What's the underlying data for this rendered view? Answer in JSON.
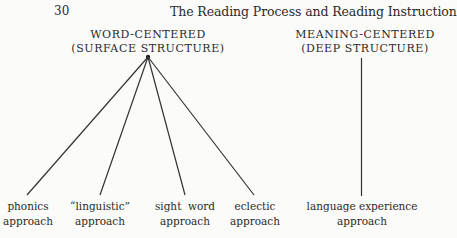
{
  "page": {
    "number": "30",
    "running_head": "The Reading Process and Reading Instruction"
  },
  "diagram": {
    "categories": [
      {
        "id": "word",
        "line1": "WORD-CENTERED",
        "line2": "(SURFACE STRUCTURE)"
      },
      {
        "id": "meaning",
        "line1": "MEANING-CENTERED",
        "line2": "(DEEP STRUCTURE)"
      }
    ],
    "approaches": [
      {
        "line1": "phonics",
        "line2": "approach",
        "parent": "word"
      },
      {
        "line1": "“linguistic”",
        "line2": "approach",
        "parent": "word"
      },
      {
        "line1": "sight  word",
        "line2": "approach",
        "parent": "word"
      },
      {
        "line1": "eclectic",
        "line2": "approach",
        "parent": "word"
      },
      {
        "line1": "language experience",
        "line2": "approach",
        "parent": "meaning"
      }
    ],
    "line_color": "#333333"
  }
}
